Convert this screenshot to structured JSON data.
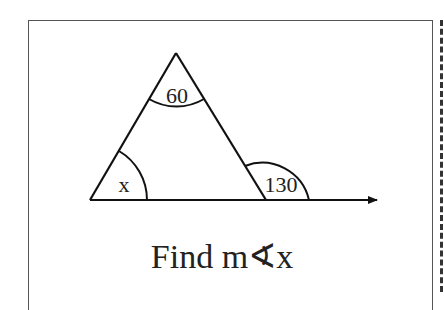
{
  "diagram": {
    "type": "triangle-exterior-angle",
    "vertices": {
      "apex": [
        176,
        53
      ],
      "left": [
        90,
        200
      ],
      "right": [
        266,
        200
      ]
    },
    "ray_end": [
      377,
      200
    ],
    "angles": {
      "apex_label": "60",
      "left_label": "x",
      "exterior_label": "130"
    },
    "caption": "Find m∢x",
    "stroke_color": "#111111"
  }
}
